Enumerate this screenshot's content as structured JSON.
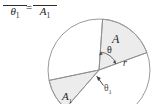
{
  "figure": {
    "name": "circle-sector-area-proportion-figure",
    "background_color": "#ffffff",
    "stroke_color": "#8a8a8a",
    "sector_fill_color": "#ececec",
    "text_color": "#1f1f1f"
  },
  "equation": {
    "left_fraction": {
      "denominator": "θ",
      "denominator_subscript": "1",
      "numerator_visible": false
    },
    "operator": "=",
    "right_fraction": {
      "denominator": "A",
      "denominator_subscript": "1",
      "numerator_visible": false
    }
  },
  "diagram": {
    "labels": {
      "sector_area": "A",
      "sector_area_sub": "",
      "sector_area_1": "A",
      "sector_area_1_sub": "1",
      "radius": "r",
      "angle": "θ",
      "angle_1": "θ",
      "angle_1_sub": "1"
    },
    "circle": {
      "center_x": 99,
      "center_y": 70,
      "radius": 51
    },
    "sectors": [
      {
        "name": "sector-A",
        "angle_label": "θ",
        "area_label": "A",
        "start_angle_deg": -86,
        "end_angle_deg": -20
      },
      {
        "name": "sector-A1",
        "angle_label": "θ1",
        "area_label": "A1",
        "start_angle_deg": 131,
        "end_angle_deg": 168
      }
    ]
  }
}
